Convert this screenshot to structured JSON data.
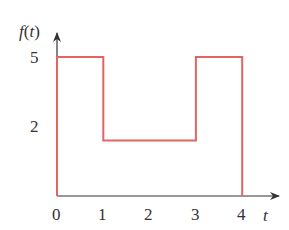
{
  "chart_data": {
    "type": "line",
    "subtype": "step",
    "title": "",
    "xlabel": "t",
    "ylabel": "f(t)",
    "x_ticks": [
      "0",
      "1",
      "2",
      "3",
      "4"
    ],
    "y_ticks": [
      "5",
      "2"
    ],
    "xlim": [
      0,
      4.8
    ],
    "ylim": [
      0,
      6.2
    ],
    "grid": false,
    "legend": null,
    "series": [
      {
        "name": "f(t)",
        "color": "#e06666",
        "points": [
          [
            0,
            0
          ],
          [
            0,
            5
          ],
          [
            1,
            5
          ],
          [
            1,
            2
          ],
          [
            3,
            2
          ],
          [
            3,
            5
          ],
          [
            4,
            5
          ],
          [
            4,
            0
          ]
        ]
      }
    ],
    "piecewise": [
      {
        "from": 0,
        "to": 1,
        "value": 5
      },
      {
        "from": 1,
        "to": 3,
        "value": 2
      },
      {
        "from": 3,
        "to": 4,
        "value": 5
      }
    ]
  },
  "axis": {
    "y_label_f": "f",
    "y_label_paren_open": "(",
    "y_label_t": "t",
    "y_label_paren_close": ")",
    "x_label": "t",
    "x_tick_labels": [
      "0",
      "1",
      "2",
      "3",
      "4"
    ],
    "y_tick_5": "5",
    "y_tick_2": "2"
  },
  "colors": {
    "signal": "#e06666",
    "axis": "#333333"
  }
}
